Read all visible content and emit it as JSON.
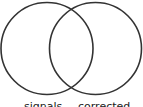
{
  "diagram": {
    "type": "venn",
    "stroke_color": "#333333",
    "sets": [
      {
        "label": "signals",
        "cx": 47,
        "cy": 48,
        "r": 46
      },
      {
        "label": "corrected",
        "cx": 95,
        "cy": 48,
        "r": 46
      }
    ]
  }
}
